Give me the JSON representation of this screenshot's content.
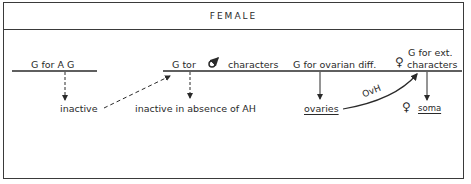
{
  "panel": {
    "title": "FEMALE"
  },
  "genes": {
    "ag": {
      "label": "G for A G",
      "result": "inactive"
    },
    "male_chars": {
      "label_prefix": "G tor",
      "symbol": "♂",
      "label_suffix": "characters",
      "result": "inactive in absence of AH"
    },
    "ovarian": {
      "label": "G for ovarian diff.",
      "result": "ovaries"
    },
    "ext_female": {
      "label_line1": "G for ext.",
      "symbol": "♀",
      "label_line2": "characters",
      "result_symbol": "♀",
      "result": "soma"
    }
  },
  "edges": {
    "hormone_label": "OvH"
  },
  "colors": {
    "ink": "#2a2a2a",
    "border": "#3a3a3a",
    "background": "#ffffff"
  }
}
